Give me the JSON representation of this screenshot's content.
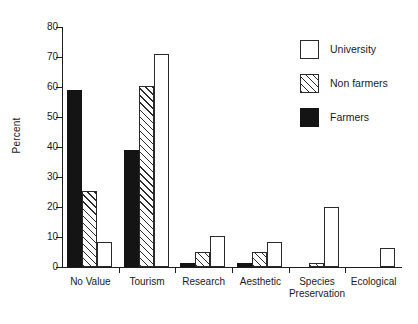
{
  "chart_data": {
    "type": "bar",
    "title": "",
    "subtitle": "",
    "xlabel": "",
    "ylabel": "Percent",
    "ylim": [
      0,
      80
    ],
    "ytick_step": 10,
    "yticks": [
      0,
      10,
      20,
      30,
      40,
      50,
      60,
      70,
      80
    ],
    "grid": false,
    "legend_position": "top-right",
    "categories": [
      "No Value",
      "Tourism",
      "Research",
      "Aesthetic",
      "Species\nPreservation",
      "Ecological"
    ],
    "series": [
      {
        "name": "Farmers",
        "fill": "solid-black",
        "color": "#141414",
        "values": [
          59,
          39,
          1.5,
          1.5,
          0,
          0
        ]
      },
      {
        "name": "Non farmers",
        "fill": "diagonal-hatch",
        "color": "#2a2a2a",
        "values": [
          25.5,
          60.5,
          5,
          5,
          1.5,
          0
        ]
      },
      {
        "name": "University",
        "fill": "open-white",
        "color": "#ffffff",
        "values": [
          8.5,
          71,
          10.5,
          8.5,
          20,
          6.5
        ]
      }
    ],
    "bar_order_in_group": [
      "Farmers",
      "Non farmers",
      "University"
    ]
  },
  "legend": {
    "entries": [
      {
        "label": "University",
        "swatch": "open-white"
      },
      {
        "label": "Non farmers",
        "swatch": "diagonal-hatch"
      },
      {
        "label": "Farmers",
        "swatch": "solid-black"
      }
    ]
  },
  "axis": {
    "y_title": "Percent"
  }
}
